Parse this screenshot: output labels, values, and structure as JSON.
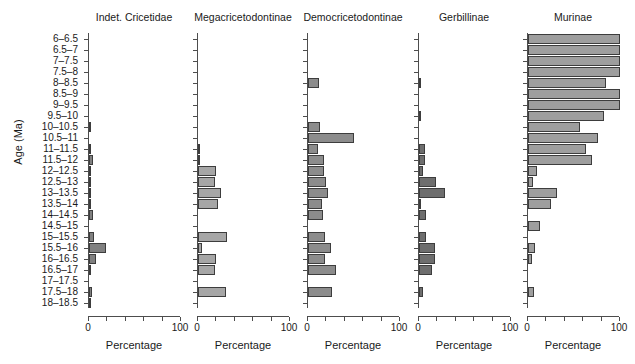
{
  "figure": {
    "ylabel": "Age (Ma)",
    "xlabel": "Percentage",
    "age_bins": [
      "6–6.5",
      "6.5–7",
      "7–7.5",
      "7.5–8",
      "8–8.5",
      "8.5–9",
      "9–9.5",
      "9.5–10",
      "10–10.5",
      "10.5–11",
      "11–11.5",
      "11.5–12",
      "12–12.5",
      "12.5–13",
      "13–13.5",
      "13.5–14",
      "14–14.5",
      "14.5–15",
      "15–15.5",
      "15.5–16",
      "16–16.5",
      "16.5–17",
      "17–17.5",
      "17.5–18",
      "18–18.5"
    ],
    "xticks": [
      "0",
      "",
      "",
      "",
      "",
      "100"
    ],
    "xtick_values": [
      0,
      20,
      40,
      60,
      80,
      100
    ],
    "xtick_labels_shown": [
      "0",
      "100"
    ]
  },
  "chart_data": {
    "type": "bar",
    "orientation": "horizontal",
    "title": "",
    "xlabel": "Percentage",
    "ylabel": "Age (Ma)",
    "xlim": [
      0,
      100
    ],
    "grid": false,
    "legend": "none",
    "categories": [
      "6–6.5",
      "6.5–7",
      "7–7.5",
      "7.5–8",
      "8–8.5",
      "8.5–9",
      "9–9.5",
      "9.5–10",
      "10–10.5",
      "10.5–11",
      "11–11.5",
      "11.5–12",
      "12–12.5",
      "12.5–13",
      "13–13.5",
      "13.5–14",
      "14–14.5",
      "14.5–15",
      "15–15.5",
      "15.5–16",
      "16–16.5",
      "16.5–17",
      "17–17.5",
      "17.5–18",
      "18–18.5"
    ],
    "panels": [
      {
        "name": "Indet. Cricetidae",
        "color": "#808080",
        "values": [
          0,
          0,
          0,
          0,
          0,
          0,
          0,
          0,
          1.5,
          0,
          1,
          4,
          0.6,
          0.6,
          1,
          2.5,
          4.5,
          0,
          5,
          18,
          8,
          2,
          0,
          3,
          0.5
        ]
      },
      {
        "name": "Megacricetodontinae",
        "color": "#a6a6a6",
        "values": [
          0,
          0,
          0,
          0,
          0,
          0,
          0,
          0,
          0,
          0,
          1.5,
          1,
          20,
          18,
          25,
          22,
          0,
          0,
          32,
          4,
          20,
          18,
          0,
          30,
          0
        ]
      },
      {
        "name": "Democricetodontinae",
        "color": "#8c8c8c",
        "values": [
          0,
          0,
          0,
          0,
          12,
          0,
          0,
          0,
          13,
          50,
          11,
          17,
          17,
          20,
          22,
          15,
          16,
          0,
          18,
          25,
          18,
          30,
          0,
          26,
          0
        ]
      },
      {
        "name": "Gerbillinae",
        "color": "#6e6e6e",
        "values": [
          0,
          0,
          0,
          0,
          2,
          0,
          0,
          1.5,
          0,
          0,
          6,
          6,
          4,
          18,
          28,
          2,
          8,
          0,
          8,
          17,
          17,
          14,
          0,
          4,
          0
        ]
      },
      {
        "name": "Murinae",
        "color": "#9e9e9e",
        "values": [
          100,
          100,
          100,
          100,
          85,
          100,
          100,
          83,
          56,
          76,
          63,
          70,
          10,
          5,
          32,
          25,
          0,
          13,
          0,
          8,
          4,
          0,
          0,
          6,
          0
        ]
      }
    ]
  }
}
